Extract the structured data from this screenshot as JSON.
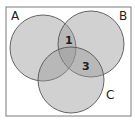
{
  "diagram": {
    "type": "venn-3",
    "frame": {
      "x": 6,
      "y": 7,
      "width": 125,
      "height": 109,
      "stroke": "#7a7a7a",
      "fill": "#ffffff"
    },
    "sets": [
      {
        "id": "A",
        "label": "A",
        "cx": 43,
        "cy": 48,
        "r": 33,
        "label_x": 11,
        "label_y": 20
      },
      {
        "id": "B",
        "label": "B",
        "cx": 91,
        "cy": 44,
        "r": 33,
        "label_x": 119,
        "label_y": 20
      },
      {
        "id": "C",
        "label": "C",
        "cx": 71,
        "cy": 80,
        "r": 33,
        "label_x": 106,
        "label_y": 99
      }
    ],
    "region_values": [
      {
        "region": "A∩B only",
        "value": "1",
        "x": 65,
        "y": 44
      },
      {
        "region": "B∩C only",
        "value": "3",
        "x": 82,
        "y": 70
      }
    ],
    "colors": {
      "circle_fill": "#9a9a9a",
      "circle_opacity": "0.45",
      "circle_stroke": "#555555"
    }
  }
}
